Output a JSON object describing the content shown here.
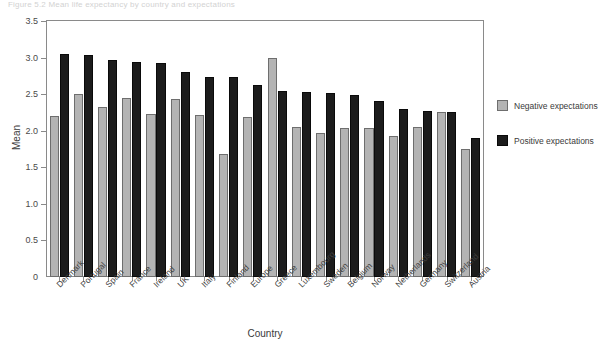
{
  "figure": {
    "caption": "Figure 5.2 Mean life expectancy by country and expectations"
  },
  "chart_data": {
    "type": "bar",
    "title": "",
    "xlabel": "Country",
    "ylabel": "Mean",
    "ylim": [
      0,
      3.5
    ],
    "yticks": [
      "0",
      "0.5",
      "1.0",
      "1.5",
      "2.0",
      "2.5",
      "3.0",
      "3.5"
    ],
    "ytick_values": [
      0,
      0.5,
      1.0,
      1.5,
      2.0,
      2.5,
      3.0,
      3.5
    ],
    "grid": false,
    "legend_position": "right",
    "categories": [
      "Denmark",
      "Portugal",
      "Spain",
      "France",
      "Ireland",
      "UK",
      "Italy",
      "Finland",
      "Europe",
      "Greece",
      "Luxembourg",
      "Sweden",
      "Belgium",
      "Norway",
      "Netherlands",
      "Germany",
      "Switzerland",
      "Austria"
    ],
    "series": [
      {
        "name": "Negative expectations",
        "color": "#b4b4b4",
        "values": [
          2.2,
          2.5,
          2.32,
          2.45,
          2.23,
          2.43,
          2.22,
          1.68,
          2.19,
          3.0,
          2.05,
          1.97,
          2.04,
          2.04,
          1.93,
          2.05,
          2.25,
          1.75
        ]
      },
      {
        "name": "Positive expectations",
        "color": "#1c1c1c",
        "values": [
          3.05,
          3.03,
          2.97,
          2.94,
          2.92,
          2.8,
          2.73,
          2.73,
          2.62,
          2.55,
          2.53,
          2.52,
          2.49,
          2.41,
          2.3,
          2.27,
          2.26,
          1.9
        ]
      }
    ]
  }
}
